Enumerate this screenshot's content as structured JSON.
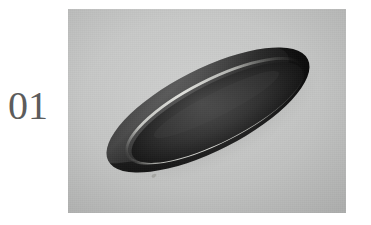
{
  "page": {
    "background_color": "#ffffff",
    "width": 371,
    "height": 225
  },
  "panel": {
    "label": "01",
    "label_color": "#5c5c5c"
  },
  "photo": {
    "background_color": "#c6c7c6",
    "background_color_light": "#cacbca",
    "background_color_dark": "#bfc0bf",
    "frame": {
      "x": 68,
      "y": 9,
      "width": 278,
      "height": 204
    }
  },
  "object": {
    "name": "oval-dish",
    "description": "dark elliptical dish",
    "body_color": "#161616",
    "rim_color": "#242424",
    "rim_highlight_color": "#b9bab6",
    "well_color": "#1b1b1b",
    "shadow_color": "#9a9b99",
    "rotation_degrees": -27,
    "center": {
      "x": 140,
      "y": 101
    },
    "radius_x": 112,
    "radius_y": 41
  }
}
